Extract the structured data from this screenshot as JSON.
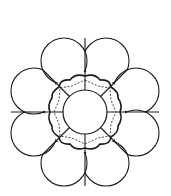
{
  "diagram": {
    "title": "",
    "petal_count": 8,
    "stroke_color": "#1a1a1a",
    "background": "#ffffff",
    "center": [
      85,
      112
    ],
    "inner_circle_radius": 22,
    "wavy_ring_radius": 35,
    "petal_radius": 23,
    "petal_distance": 55
  }
}
